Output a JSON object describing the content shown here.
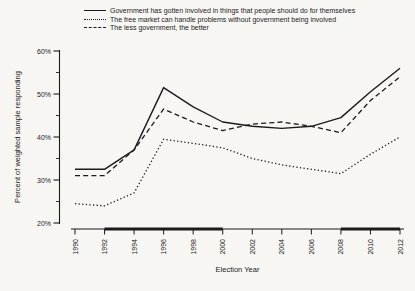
{
  "page": {
    "background": "#f7f6f3",
    "ink": "#1b1b1b"
  },
  "chart_data": {
    "type": "line",
    "title": "",
    "xlabel": "Election Year",
    "ylabel": "Percent of weighted sample responding",
    "x": [
      1990,
      1992,
      1994,
      1996,
      1998,
      2000,
      2002,
      2004,
      2006,
      2008,
      2010,
      2012
    ],
    "xlim": [
      1990,
      2012
    ],
    "ylim": [
      20,
      60
    ],
    "yticks": [
      20,
      30,
      40,
      50,
      60
    ],
    "ytick_labels": [
      "20%",
      "30%",
      "40%",
      "50%",
      "60%"
    ],
    "yminor_ticks": [
      25,
      35,
      45,
      55
    ],
    "grid": false,
    "legend_position": "top-left",
    "line_color": "#1b1b1b",
    "series": [
      {
        "name": "Government has gotten involved in things that people should do for themselves",
        "line_style": "solid",
        "values": [
          32.5,
          32.5,
          37,
          51.5,
          47,
          43.5,
          42.5,
          42,
          42.5,
          44.5,
          50.5,
          56
        ]
      },
      {
        "name": "The free market can handle problems without government being involved",
        "line_style": "dotted",
        "values": [
          24.5,
          24,
          27,
          39.5,
          38.5,
          37.5,
          35,
          33.5,
          32.5,
          31.5,
          36,
          40
        ]
      },
      {
        "name": "The less government, the better",
        "line_style": "dashed",
        "values": [
          31,
          31,
          37,
          46.5,
          43.5,
          41.5,
          43,
          43.5,
          42.5,
          41,
          48.5,
          54
        ]
      }
    ],
    "x_axis_thick_segments": [
      {
        "from": 1992,
        "to": 2000
      },
      {
        "from": 2008,
        "to": 2012
      }
    ]
  }
}
